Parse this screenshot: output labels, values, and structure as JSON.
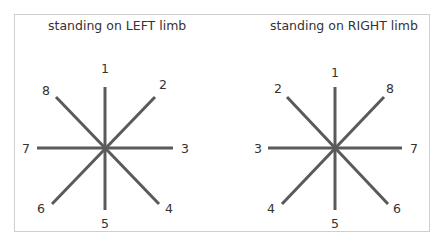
{
  "diagrams": [
    {
      "title": "standing on LEFT limb",
      "center": [
        105,
        148
      ],
      "labels": {
        "top": "1",
        "upper_right": "2",
        "right": "3",
        "lower_right": "4",
        "bottom": "5",
        "lower_left": "6",
        "left": "7",
        "upper_left": "8"
      }
    },
    {
      "title": "standing on RIGHT limb",
      "center": [
        335,
        148
      ],
      "labels": {
        "top": "1",
        "upper_left": "2",
        "left": "3",
        "lower_left": "4",
        "bottom": "5",
        "lower_right": "6",
        "right": "7",
        "upper_right": "8"
      }
    }
  ],
  "colors": {
    "line": "#5a5a5a",
    "text": "#333333",
    "frame": "#cfcfcf"
  }
}
